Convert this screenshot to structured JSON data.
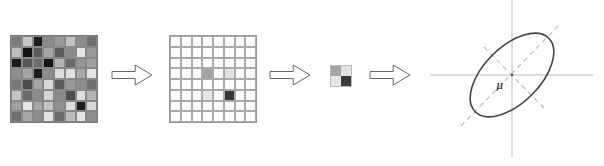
{
  "diagram": {
    "title": "",
    "stages": [
      {
        "name": "input-image-patch",
        "rows": 8,
        "cols": 8,
        "cells": [
          [
            "#7a7a7a",
            "#c8c8c8",
            "#1a1a1a",
            "#8a8a8a",
            "#9a9a9a",
            "#c0c0c0",
            "#8c8c8c",
            "#707070"
          ],
          [
            "#bdbdbd",
            "#111111",
            "#5a5a5a",
            "#a4a4a4",
            "#5c5c5c",
            "#8a8a8a",
            "#e6e6e6",
            "#9a9a9a"
          ],
          [
            "#1c1c1c",
            "#555555",
            "#6e6e6e",
            "#161616",
            "#b4b4b4",
            "#6a6a6a",
            "#969696",
            "#a2a2a2"
          ],
          [
            "#8e8e8e",
            "#a6a6a6",
            "#1e1e1e",
            "#8c8c8c",
            "#dcdcdc",
            "#e0e0e0",
            "#a8a8a8",
            "#e4e4e4"
          ],
          [
            "#7a7a7a",
            "#4a4a4a",
            "#a6a6a6",
            "#dadada",
            "#5a5a5a",
            "#9a9a9a",
            "#8c8c8c",
            "#707070"
          ],
          [
            "#c4c4c4",
            "#6a6a6a",
            "#8a8a8a",
            "#d4d4d4",
            "#8a8a8a",
            "#4e4e4e",
            "#e0e0e0",
            "#b4b4b4"
          ],
          [
            "#a0a0a0",
            "#e6e6e6",
            "#a6a6a6",
            "#c4c4c4",
            "#909090",
            "#dcdcdc",
            "#1c1c1c",
            "#d8d8d8"
          ],
          [
            "#6e6e6e",
            "#a8a8a8",
            "#8c8c8c",
            "#e2e2e2",
            "#6a6a6a",
            "#bcbcbc",
            "#e4e4e4",
            "#8c8c8c"
          ]
        ]
      },
      {
        "name": "sparse-selection-grid",
        "rows": 8,
        "cols": 8,
        "default_color": "#ffffff",
        "highlighted": [
          {
            "row": 3,
            "col": 3,
            "color": "#a4a4a4"
          },
          {
            "row": 3,
            "col": 5,
            "color": "#e2e2e2"
          },
          {
            "row": 5,
            "col": 3,
            "color": "#e6e6e6"
          },
          {
            "row": 5,
            "col": 5,
            "color": "#3a3a3a"
          }
        ]
      },
      {
        "name": "2x2-patch",
        "rows": 2,
        "cols": 2,
        "cells": [
          [
            "#a4a4a4",
            "#e2e2e2"
          ],
          [
            "#e6e6e6",
            "#3a3a3a"
          ]
        ]
      },
      {
        "name": "gaussian-ellipse",
        "label": "μ",
        "ellipse": {
          "cx": 512,
          "cy": 75,
          "rx": 52,
          "ry": 28,
          "rotation_deg": -45
        },
        "axes": {
          "h": {
            "x1": 430,
            "x2": 593,
            "y": 75
          },
          "v": {
            "x": 512,
            "y1": 0,
            "y2": 157
          }
        },
        "principal_axes": [
          {
            "x1": 461,
            "y1": 126,
            "x2": 558,
            "y2": 26
          },
          {
            "x1": 484,
            "y1": 47,
            "x2": 544,
            "y2": 108
          }
        ]
      }
    ],
    "arrows": [
      {
        "x": 112,
        "y": 65,
        "w": 40,
        "h": 20
      },
      {
        "x": 270,
        "y": 65,
        "w": 40,
        "h": 20
      },
      {
        "x": 370,
        "y": 65,
        "w": 40,
        "h": 20
      }
    ],
    "colors": {
      "stroke": "#666666",
      "axis": "#bbbbbb",
      "dashed": "#bdbdbd",
      "ellipse": "#444444"
    }
  }
}
